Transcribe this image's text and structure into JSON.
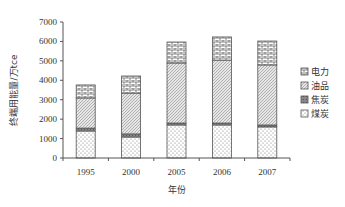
{
  "chart_data": {
    "type": "bar",
    "stacked": true,
    "title": "",
    "xlabel": "年份",
    "ylabel": "终端用能量/万tce",
    "ylim": [
      0,
      7000
    ],
    "yticks": [
      0,
      1000,
      2000,
      3000,
      4000,
      5000,
      6000,
      7000
    ],
    "grid": false,
    "legend_position": "right",
    "categories": [
      "1995",
      "2000",
      "2005",
      "2006",
      "2007"
    ],
    "series": [
      {
        "name": "煤炭",
        "pattern": "dots",
        "values": [
          1390,
          1080,
          1700,
          1700,
          1600
        ]
      },
      {
        "name": "焦炭",
        "pattern": "dark-gray",
        "values": [
          150,
          160,
          100,
          100,
          100
        ]
      },
      {
        "name": "油品",
        "pattern": "diagonal",
        "values": [
          1550,
          2100,
          3090,
          3240,
          3090
        ]
      },
      {
        "name": "电力",
        "pattern": "brick",
        "values": [
          670,
          880,
          1080,
          1190,
          1230
        ]
      }
    ]
  },
  "legend": {
    "items": [
      "电力",
      "油品",
      "焦炭",
      "煤炭"
    ]
  }
}
